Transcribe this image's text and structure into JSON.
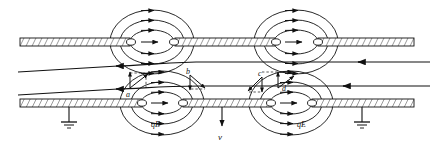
{
  "figure": {
    "kind": "physics-schematic",
    "title": "",
    "background_color": "#ffffff",
    "ink_color": "#111111"
  },
  "labels": {
    "point_a": "a",
    "point_b": "b",
    "point_c": "c",
    "point_d": "d",
    "force_left": "qE",
    "force_right": "qE",
    "velocity": "v"
  },
  "icons": {
    "ground_left": "ground-icon",
    "ground_right": "ground-icon",
    "velocity_arrow": "arrow-down-icon",
    "field_arrow": "arrow-right-icon"
  },
  "structures": {
    "plates": [
      {
        "name": "upper-plate-left",
        "x": 20,
        "y": 38,
        "w": 110,
        "h": 8
      },
      {
        "name": "upper-plate-mid",
        "x": 175,
        "y": 38,
        "w": 100,
        "h": 8
      },
      {
        "name": "upper-plate-right",
        "x": 318,
        "y": 38,
        "w": 96,
        "h": 8
      },
      {
        "name": "lower-plate-left",
        "x": 20,
        "y": 99,
        "w": 122,
        "h": 8
      },
      {
        "name": "lower-plate-mid",
        "x": 183,
        "y": 99,
        "w": 88,
        "h": 8
      },
      {
        "name": "lower-plate-right",
        "x": 312,
        "y": 99,
        "w": 102,
        "h": 8
      }
    ],
    "gaps": [
      {
        "name": "upper-gap-1",
        "cx": 152,
        "cy": 42
      },
      {
        "name": "upper-gap-2",
        "cx": 296,
        "cy": 42
      },
      {
        "name": "lower-gap-1",
        "cx": 162,
        "cy": 103
      },
      {
        "name": "lower-gap-2",
        "cx": 291,
        "cy": 103
      }
    ],
    "trajectories": [
      {
        "name": "trajectory-upper",
        "y_left": 72,
        "y_right": 62
      },
      {
        "name": "trajectory-lower",
        "y_left": 95,
        "y_right": 86
      }
    ]
  }
}
